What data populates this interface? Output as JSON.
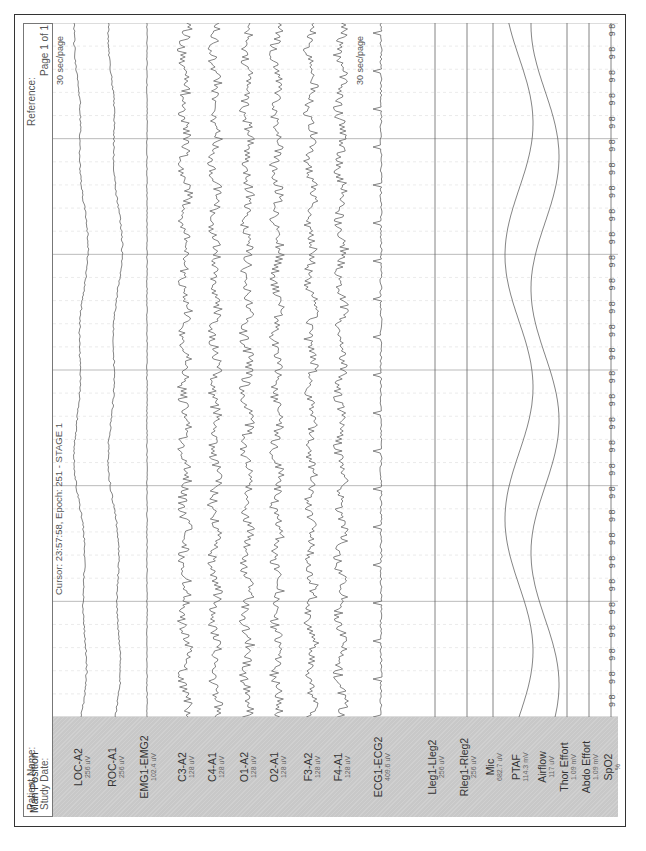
{
  "header": {
    "patient_name_label": "Patient Name:",
    "study_date_label": "Study Date:",
    "reference_label": "Reference:",
    "page_label": "Page 1 of 1"
  },
  "cursor": {
    "text": "Cursor: 23:57:58, Epoch: 251 - STAGE 1"
  },
  "timescale": {
    "top_label": "30 sec/page",
    "lower_label": "30 sec/page"
  },
  "channels": [
    {
      "name": "Man Position",
      "scale": ""
    },
    {
      "name": "LOC-A2",
      "scale": "256 uV"
    },
    {
      "name": "ROC-A1",
      "scale": "256 uV"
    },
    {
      "name": "EMG1-EMG2",
      "scale": "102.4 uV"
    },
    {
      "name": "C3-A2",
      "scale": "128 uV"
    },
    {
      "name": "C4-A1",
      "scale": "128 uV"
    },
    {
      "name": "O1-A2",
      "scale": "128 uV"
    },
    {
      "name": "O2-A1",
      "scale": "128 uV"
    },
    {
      "name": "F3-A2",
      "scale": "128 uV"
    },
    {
      "name": "F4-A1",
      "scale": "128 uV"
    },
    {
      "name": "ECG1-ECG2",
      "scale": "409.6 uV"
    },
    {
      "name": "Lleg1-Lleg2",
      "scale": "256 uV"
    },
    {
      "name": "Rleg1-Rleg2",
      "scale": "256 uV"
    },
    {
      "name": "Mic",
      "scale": "682.7 uV"
    },
    {
      "name": "PTAF",
      "scale": "114.3 mV"
    },
    {
      "name": "Airflow",
      "scale": "117 uV"
    },
    {
      "name": "Thor Effort",
      "scale": "1.09 mV"
    },
    {
      "name": "Abdo Effort",
      "scale": "1.09 mV"
    },
    {
      "name": "SpO2",
      "scale": "%"
    }
  ],
  "spo2_axis": {
    "max": "100",
    "min": "0",
    "readout_tens": "9",
    "readout_units": "8"
  },
  "chart_data": {
    "type": "line",
    "xlabel": "time (30 sec/page)",
    "ylabel": "channels",
    "x_range_sec": [
      0,
      30
    ],
    "grid": true,
    "series": [
      {
        "name": "LOC-A2",
        "scale": "256 uV"
      },
      {
        "name": "ROC-A1",
        "scale": "256 uV"
      },
      {
        "name": "EMG1-EMG2",
        "scale": "102.4 uV"
      },
      {
        "name": "C3-A2",
        "scale": "128 uV"
      },
      {
        "name": "C4-A1",
        "scale": "128 uV"
      },
      {
        "name": "O1-A2",
        "scale": "128 uV"
      },
      {
        "name": "O2-A1",
        "scale": "128 uV"
      },
      {
        "name": "F3-A2",
        "scale": "128 uV"
      },
      {
        "name": "F4-A1",
        "scale": "128 uV"
      },
      {
        "name": "ECG1-ECG2",
        "scale": "409.6 uV"
      },
      {
        "name": "Lleg1-Lleg2",
        "scale": "256 uV"
      },
      {
        "name": "Rleg1-Rleg2",
        "scale": "256 uV"
      },
      {
        "name": "Mic",
        "scale": "682.7 uV"
      },
      {
        "name": "PTAF",
        "scale": "114.3 mV"
      },
      {
        "name": "Airflow",
        "scale": "117 uV"
      },
      {
        "name": "Thor Effort",
        "scale": "1.09 mV"
      },
      {
        "name": "Abdo Effort",
        "scale": "1.09 mV"
      },
      {
        "name": "SpO2",
        "scale": "%",
        "values_constant": 98
      }
    ],
    "spo2_readout_per_second": 98
  },
  "caption": "Figure: polysomnography epoch showing stage 1 sleep"
}
